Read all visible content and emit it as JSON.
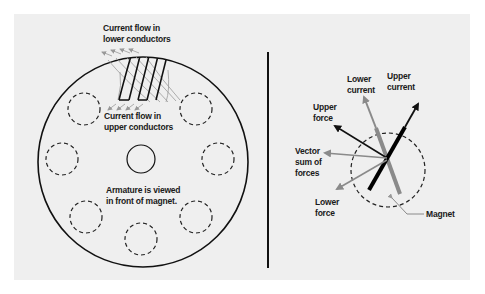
{
  "diagram": {
    "left_panel": {
      "labels": {
        "lower_conductors": [
          "Current flow in",
          "lower conductors"
        ],
        "upper_conductors": [
          "Current flow in",
          "upper conductors"
        ],
        "armature_note": [
          "Armature is viewed",
          "in front of magnet."
        ]
      },
      "elements": {
        "armature": "large circle",
        "shaft": "small center circle",
        "slots": "7 dashed circles",
        "conductors": "slanted coil windings at top"
      }
    },
    "right_panel": {
      "labels": {
        "lower_current": [
          "Lower",
          "current"
        ],
        "upper_current": [
          "Upper",
          "current"
        ],
        "upper_force": [
          "Upper",
          "force"
        ],
        "vector_sum": [
          "Vector",
          "sum of",
          "forces"
        ],
        "lower_force": [
          "Lower",
          "force"
        ],
        "magnet": "Magnet"
      },
      "colors": {
        "upper": "#111111",
        "lower": "#8a8a8a",
        "magnet_black": "#000000",
        "magnet_gray": "#8a8a8a"
      }
    },
    "colors": {
      "background": "#efefef",
      "line": "#111111",
      "gray": "#8a8a8a"
    }
  }
}
